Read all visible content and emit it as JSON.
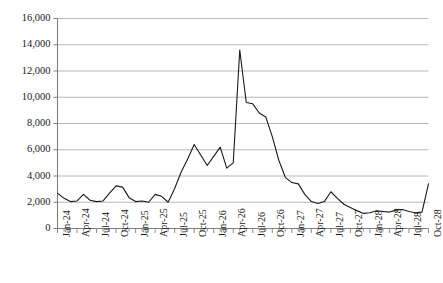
{
  "chart_data": {
    "type": "line",
    "title": "",
    "subtitle": "",
    "xlabel": "",
    "ylabel": "",
    "ylim": [
      0,
      16000
    ],
    "grid": true,
    "legend": null,
    "y_ticks": [
      0,
      2000,
      4000,
      6000,
      8000,
      10000,
      12000,
      14000,
      16000
    ],
    "y_tick_labels": [
      "0",
      "2,000",
      "4,000",
      "6,000",
      "8,000",
      "10,000",
      "12,000",
      "14,000",
      "16,000"
    ],
    "x_tick_labels": [
      "Jan-24",
      "Apr-24",
      "Jul-24",
      "Oct-24",
      "Jan-25",
      "Apr-25",
      "Jul-25",
      "Oct-25",
      "Jan-26",
      "Apr-26",
      "Jul-26",
      "Oct-26",
      "Jan-27",
      "Apr-27",
      "Jul-27",
      "Oct-27",
      "Jan-28",
      "Apr-28",
      "Jul-28",
      "Oct-28"
    ],
    "x_tick_interval_months": 3,
    "x_minor_tick_interval_months": 1,
    "line_color": "#1a1a1a",
    "grid_color": "#b0b0b0",
    "axis_color": "#808080",
    "x": [
      "Jan-24",
      "Feb-24",
      "Mar-24",
      "Apr-24",
      "May-24",
      "Jun-24",
      "Jul-24",
      "Aug-24",
      "Sep-24",
      "Oct-24",
      "Nov-24",
      "Dec-24",
      "Jan-25",
      "Feb-25",
      "Mar-25",
      "Apr-25",
      "May-25",
      "Jun-25",
      "Jul-25",
      "Aug-25",
      "Sep-25",
      "Oct-25",
      "Nov-25",
      "Dec-25",
      "Jan-26",
      "Feb-26",
      "Mar-26",
      "Apr-26",
      "May-26",
      "Jun-26",
      "Jul-26",
      "Aug-26",
      "Sep-26",
      "Oct-26",
      "Nov-26",
      "Dec-26",
      "Jan-27",
      "Feb-27",
      "Mar-27",
      "Apr-27",
      "May-27",
      "Jun-27",
      "Jul-27",
      "Aug-27",
      "Sep-27",
      "Oct-27",
      "Nov-27",
      "Dec-27",
      "Jan-28",
      "Feb-28",
      "Mar-28",
      "Apr-28",
      "May-28",
      "Jun-28",
      "Jul-28",
      "Aug-28",
      "Sep-28",
      "Oct-28"
    ],
    "values": [
      2700,
      2300,
      2050,
      2100,
      2600,
      2150,
      2050,
      2100,
      2700,
      3250,
      3150,
      2350,
      2050,
      2100,
      2000,
      2600,
      2450,
      2000,
      3050,
      4300,
      5300,
      6400,
      5600,
      4800,
      5500,
      6200,
      4600,
      5000,
      13600,
      9600,
      9500,
      8800,
      8500,
      7000,
      5200,
      3900,
      3500,
      3400,
      2600,
      2050,
      1900,
      2050,
      2800,
      2300,
      1850,
      1600,
      1350,
      1150,
      1200,
      1350,
      1300,
      1250,
      1400,
      1450,
      1300,
      1200,
      1250,
      3400
    ]
  }
}
